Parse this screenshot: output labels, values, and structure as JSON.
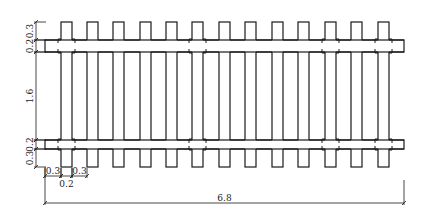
{
  "diagram": {
    "type": "plan-view",
    "line_color": "#1a1a1a",
    "background": "#ffffff",
    "sleepers": {
      "count": 14,
      "x_positions": [
        61,
        87,
        113,
        140,
        166,
        192,
        219,
        245,
        272,
        298,
        325,
        351,
        378
      ],
      "width_px": 11,
      "top_y": 22,
      "bottom_y": 167,
      "fastened_indices": [
        0,
        5,
        10,
        13
      ]
    },
    "rails": {
      "left_x": 45,
      "right_x": 404,
      "upper": {
        "top_y": 40,
        "bottom_y": 52
      },
      "lower": {
        "top_y": 140,
        "bottom_y": 149
      }
    },
    "dimensions": {
      "vertical": [
        {
          "label": "0.3",
          "from_y": 22,
          "to_y": 40
        },
        {
          "label": "0.2",
          "from_y": 40,
          "to_y": 52
        },
        {
          "label": "1.6",
          "from_y": 52,
          "to_y": 140
        },
        {
          "label": "0.2",
          "from_y": 140,
          "to_y": 149
        },
        {
          "label": "0.3",
          "from_y": 149,
          "to_y": 167
        }
      ],
      "horizontal_small": [
        {
          "label": "0.3",
          "from_x": 45,
          "to_x": 61
        },
        {
          "label": "0.2",
          "from_x": 61,
          "to_x": 72
        },
        {
          "label": "0.3",
          "from_x": 72,
          "to_x": 87
        }
      ],
      "overall": {
        "label": "6.8",
        "from_x": 45,
        "to_x": 404
      }
    }
  }
}
